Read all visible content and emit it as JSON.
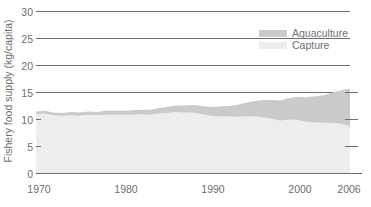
{
  "chart_data": {
    "type": "area",
    "stacked": true,
    "title": "",
    "xlabel": "",
    "ylabel": "Fishery food supply (kg/capita)",
    "xlim": [
      1970,
      2006
    ],
    "ylim": [
      0,
      30
    ],
    "yticks": [
      0,
      5,
      10,
      15,
      20,
      25,
      30
    ],
    "ytick_labels": [
      "0",
      "5",
      "10",
      "15",
      "20",
      "25",
      "30"
    ],
    "xticks": [
      1970,
      1980,
      1990,
      2000,
      2006
    ],
    "xtick_labels": [
      "1970",
      "1980",
      "1990",
      "2000",
      "2006"
    ],
    "gridlines_at": [
      15,
      20,
      25,
      30
    ],
    "grid": true,
    "legend_position": "top-right",
    "legend": [
      "Aquaculture",
      "Capture"
    ],
    "colors": {
      "aquaculture": "#c9cacb",
      "capture": "#ededee",
      "gridline": "#6d6e70",
      "axis": "#6d6e70",
      "text": "#6d6e70"
    },
    "x": [
      1970,
      1971,
      1972,
      1973,
      1974,
      1975,
      1976,
      1977,
      1978,
      1979,
      1980,
      1981,
      1982,
      1983,
      1984,
      1985,
      1986,
      1987,
      1988,
      1989,
      1990,
      1991,
      1992,
      1993,
      1994,
      1995,
      1996,
      1997,
      1998,
      1999,
      2000,
      2001,
      2002,
      2003,
      2004,
      2005,
      2006
    ],
    "series": [
      {
        "name": "Capture",
        "values": [
          11.0,
          11.1,
          10.8,
          10.7,
          10.8,
          10.7,
          10.9,
          10.8,
          10.9,
          10.9,
          10.9,
          10.9,
          11.0,
          10.9,
          11.1,
          11.2,
          11.4,
          11.3,
          11.3,
          11.0,
          10.7,
          10.6,
          10.6,
          10.5,
          10.6,
          10.6,
          10.4,
          10.2,
          9.8,
          10.0,
          9.9,
          9.6,
          9.5,
          9.4,
          9.4,
          9.2,
          8.8
        ]
      },
      {
        "name": "Aquaculture",
        "values": [
          0.5,
          0.5,
          0.5,
          0.5,
          0.6,
          0.6,
          0.6,
          0.6,
          0.7,
          0.7,
          0.7,
          0.8,
          0.8,
          0.9,
          1.0,
          1.1,
          1.2,
          1.3,
          1.4,
          1.5,
          1.6,
          1.8,
          1.9,
          2.2,
          2.5,
          2.8,
          3.2,
          3.4,
          3.7,
          4.0,
          4.3,
          4.5,
          4.8,
          5.1,
          5.6,
          6.2,
          6.9
        ]
      }
    ],
    "totals": [
      11.5,
      11.6,
      11.3,
      11.2,
      11.4,
      11.3,
      11.5,
      11.4,
      11.6,
      11.6,
      11.6,
      11.7,
      11.8,
      11.8,
      12.1,
      12.3,
      12.6,
      12.6,
      12.7,
      12.5,
      12.3,
      12.4,
      12.5,
      12.7,
      13.1,
      13.4,
      13.6,
      13.6,
      13.5,
      14.0,
      14.2,
      14.1,
      14.3,
      14.5,
      15.0,
      15.4,
      15.7
    ]
  }
}
